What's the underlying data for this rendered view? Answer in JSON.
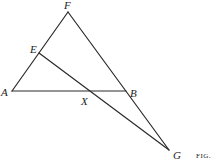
{
  "figure": {
    "caption": "FIG.",
    "points": {
      "A": {
        "label": "A",
        "x": 12,
        "y": 91
      },
      "B": {
        "label": "B",
        "x": 126,
        "y": 91
      },
      "E": {
        "label": "E",
        "x": 39,
        "y": 53
      },
      "F": {
        "label": "F",
        "x": 68,
        "y": 12
      },
      "G": {
        "label": "G",
        "x": 169,
        "y": 150
      },
      "X": {
        "label": "X",
        "x": 88,
        "y": 91
      }
    },
    "segments": [
      {
        "from": "A",
        "to": "F"
      },
      {
        "from": "F",
        "to": "G"
      },
      {
        "from": "A",
        "to": "B"
      },
      {
        "from": "E",
        "to": "G"
      }
    ]
  }
}
